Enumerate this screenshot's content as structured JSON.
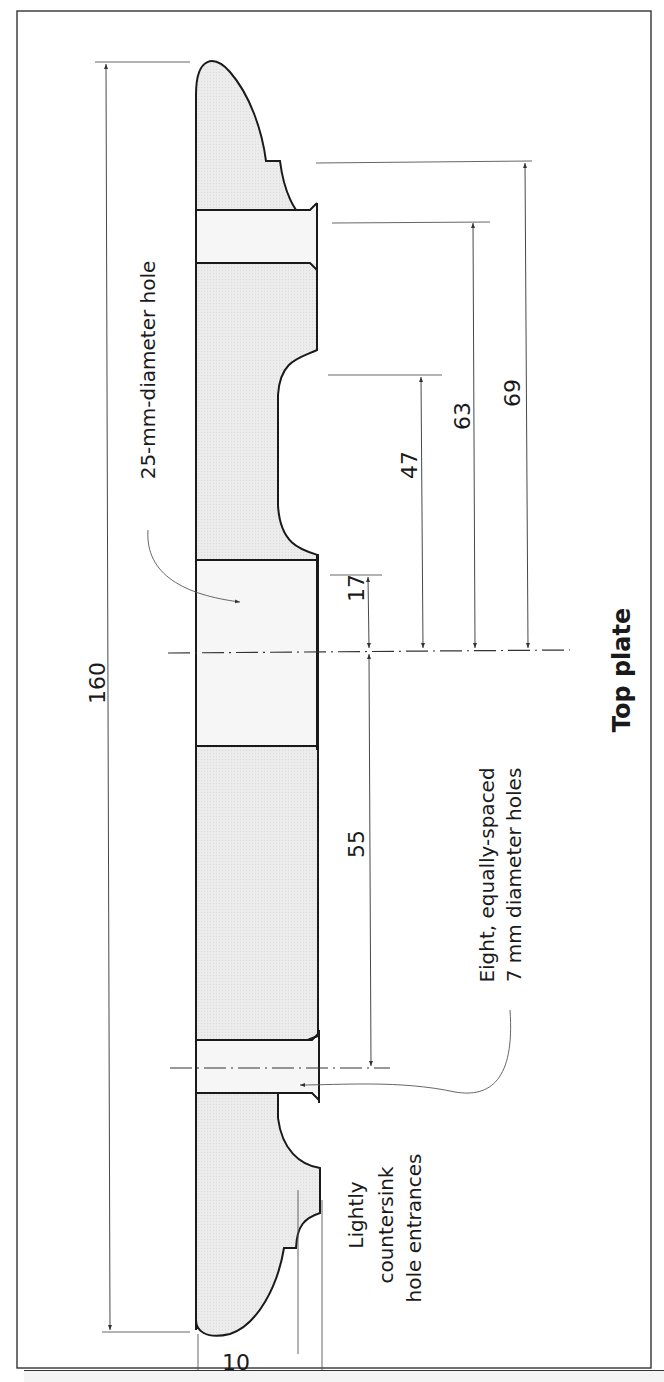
{
  "title": "Top plate",
  "labels": {
    "large_hole": "25-mm-diameter hole",
    "small_holes_line1": "Eight, equally-spaced",
    "small_holes_line2": "7 mm diameter holes",
    "countersink_line1": "Lightly",
    "countersink_line2": "countersink",
    "countersink_line3": "hole entrances"
  },
  "dimensions": {
    "overall_length": "160",
    "d_17_top": "17",
    "d_47": "47",
    "d_63": "63",
    "d_69": "69",
    "d_55": "55",
    "thickness_10": "10",
    "thickness_17": "17"
  },
  "colors": {
    "fill": "#ececec",
    "hole_fill": "#f6f6f6",
    "stroke": "#1a1a1a",
    "dim_line": "#333333"
  }
}
